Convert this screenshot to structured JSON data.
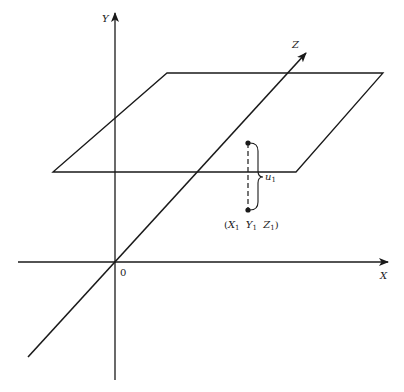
{
  "diagram": {
    "type": "3d-coordinate-axes-with-plane",
    "colors": {
      "line": "#1a1a1a",
      "background": "#ffffff"
    },
    "axes": {
      "x": {
        "label": "X"
      },
      "y": {
        "label": "Y"
      },
      "z": {
        "label": "Z"
      },
      "origin": {
        "label": "0"
      }
    },
    "point": {
      "label_prefix": "(",
      "coords": [
        {
          "name": "X",
          "sub": "1"
        },
        {
          "name": "Y",
          "sub": "1"
        },
        {
          "name": "Z",
          "sub": "1"
        }
      ],
      "label_suffix": ")"
    },
    "brace": {
      "label": "u",
      "sub": "1"
    }
  }
}
